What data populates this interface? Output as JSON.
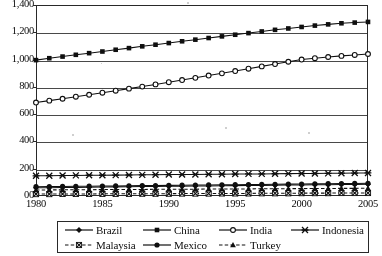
{
  "chart_data": {
    "type": "line",
    "title": "",
    "xlabel": "",
    "ylabel": "",
    "grid": true,
    "legend_position": "bottom",
    "xlim": [
      1980,
      2005
    ],
    "ylim": [
      0,
      1400
    ],
    "x": [
      1980,
      1981,
      1982,
      1983,
      1984,
      1985,
      1986,
      1987,
      1988,
      1989,
      1990,
      1991,
      1992,
      1993,
      1994,
      1995,
      1996,
      1997,
      1998,
      1999,
      2000,
      2001,
      2002,
      2003,
      2004,
      2005
    ],
    "x_ticks": [
      "1980",
      "1985",
      "1990",
      "1995",
      "2000",
      "2005"
    ],
    "y_ticks": [
      "00",
      "200",
      "400",
      "600",
      "800",
      "1,000",
      "1,200",
      "1,400"
    ],
    "y_tick_values": [
      0,
      200,
      400,
      600,
      800,
      1000,
      1200,
      1400
    ],
    "series": [
      {
        "name": "Brazil",
        "marker": "diamond",
        "dash": "solid",
        "values": [
          60,
          61,
          62,
          63,
          64,
          66,
          67,
          68,
          69,
          70,
          71,
          72,
          73,
          74,
          75,
          76,
          77,
          78,
          79,
          80,
          81,
          82,
          83,
          84,
          85,
          86
        ]
      },
      {
        "name": "China",
        "marker": "square",
        "dash": "solid",
        "values": [
          996,
          1010,
          1022,
          1035,
          1047,
          1059,
          1072,
          1084,
          1097,
          1109,
          1121,
          1134,
          1146,
          1158,
          1170,
          1182,
          1194,
          1206,
          1218,
          1228,
          1239,
          1249,
          1258,
          1266,
          1271,
          1276
        ]
      },
      {
        "name": "India",
        "marker": "circle-open",
        "dash": "solid",
        "values": [
          685,
          699,
          713,
          728,
          742,
          757,
          772,
          787,
          802,
          818,
          834,
          850,
          866,
          883,
          899,
          916,
          933,
          950,
          967,
          984,
          1000,
          1010,
          1019,
          1027,
          1034,
          1041
        ]
      },
      {
        "name": "Indonesia",
        "marker": "star",
        "dash": "solid",
        "values": [
          148,
          149,
          150,
          151,
          152,
          152,
          153,
          154,
          155,
          156,
          157,
          157,
          158,
          159,
          160,
          161,
          162,
          162,
          163,
          164,
          165,
          165,
          166,
          167,
          168,
          169
        ]
      },
      {
        "name": "Malaysia",
        "marker": "cross-box",
        "dash": "dashed",
        "values": [
          14,
          14,
          15,
          15,
          15,
          16,
          16,
          16,
          17,
          17,
          17,
          18,
          18,
          18,
          19,
          19,
          19,
          20,
          20,
          20,
          21,
          21,
          21,
          22,
          22,
          22
        ]
      },
      {
        "name": "Mexico",
        "marker": "circle-filled",
        "dash": "solid",
        "values": [
          68,
          69,
          70,
          71,
          72,
          73,
          74,
          75,
          76,
          77,
          78,
          79,
          80,
          81,
          82,
          83,
          84,
          85,
          86,
          87,
          88,
          89,
          90,
          91,
          92,
          93
        ]
      },
      {
        "name": "Turkey",
        "marker": "triangle",
        "dash": "dashed",
        "values": [
          44,
          45,
          45,
          46,
          46,
          47,
          47,
          48,
          48,
          49,
          49,
          50,
          50,
          51,
          51,
          52,
          52,
          53,
          53,
          54,
          54,
          55,
          55,
          56,
          56,
          57
        ]
      }
    ]
  },
  "legend": {
    "rows": [
      [
        {
          "label": "Brazil",
          "marker": "diamond",
          "dash": "solid"
        },
        {
          "label": "China",
          "marker": "square",
          "dash": "solid"
        },
        {
          "label": "India",
          "marker": "circle-open",
          "dash": "solid"
        },
        {
          "label": "Indonesia",
          "marker": "star",
          "dash": "solid"
        }
      ],
      [
        {
          "label": "Malaysia",
          "marker": "cross-box",
          "dash": "dashed"
        },
        {
          "label": "Mexico",
          "marker": "circle-filled",
          "dash": "solid"
        },
        {
          "label": "Turkey",
          "marker": "triangle",
          "dash": "dashed"
        }
      ]
    ]
  },
  "colors": {
    "ink": "#111111",
    "grid": "#4a4a4a",
    "frame": "#2b2b2b",
    "background": "#ffffff"
  }
}
